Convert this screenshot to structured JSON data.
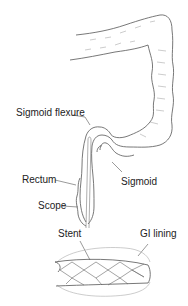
{
  "diagram": {
    "type": "anatomical illustration",
    "labels": {
      "sigmoid_flexure": "Sigmoid flexure",
      "rectum": "Rectum",
      "scope": "Scope",
      "sigmoid": "Sigmoid",
      "stent": "Stent",
      "gi_lining": "GI lining"
    },
    "colors": {
      "outline": "#555555",
      "text": "#222222",
      "light": "#aaaaaa"
    }
  }
}
